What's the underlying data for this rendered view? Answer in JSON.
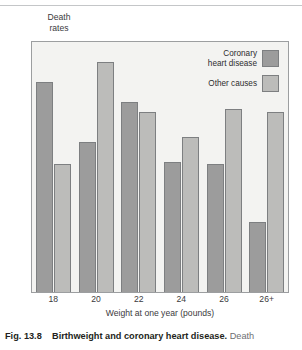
{
  "figure": {
    "y_axis_label": "Death\nrates",
    "x_axis_label": "Weight at one year (pounds)"
  },
  "legend": {
    "items": [
      {
        "label": "Coronary\nheart disease",
        "color": "#9c9c9c",
        "name": "coronary-heart-disease"
      },
      {
        "label": "Other causes",
        "color": "#bcbcba",
        "name": "other-causes"
      }
    ]
  },
  "caption": {
    "fig_number": "Fig. 13.8",
    "title": "Birthweight and coronary heart disease.",
    "rest": " Death"
  },
  "chart_data": {
    "type": "bar",
    "title": "Birthweight and coronary heart disease",
    "xlabel": "Weight at one year (pounds)",
    "ylabel": "Death rates",
    "categories": [
      "18",
      "20",
      "22",
      "24",
      "26",
      "26+"
    ],
    "legend_position": "top-right",
    "grid": false,
    "ylim": [
      0,
      100
    ],
    "series": [
      {
        "name": "Coronary heart disease",
        "color": "#9c9c9c",
        "values": [
          84,
          60,
          76,
          52,
          51,
          28
        ]
      },
      {
        "name": "Other causes",
        "color": "#bcbcba",
        "values": [
          51,
          92,
          72,
          62,
          73,
          72
        ]
      }
    ]
  }
}
